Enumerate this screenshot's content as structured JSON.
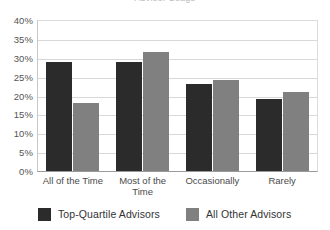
{
  "title_remnant": "Advisor Usage",
  "chart_data": {
    "type": "bar",
    "title": "",
    "xlabel": "",
    "ylabel": "",
    "ylim": [
      0,
      40
    ],
    "ytick_step": 5,
    "ytick_labels": [
      "40%",
      "35%",
      "30%",
      "25%",
      "20%",
      "15%",
      "10%",
      "5%",
      "0%"
    ],
    "ytick_values": [
      40,
      35,
      30,
      25,
      20,
      15,
      10,
      5,
      0
    ],
    "grid": true,
    "legend_position": "bottom",
    "categories": [
      "All of the Time",
      "Most of the Time",
      "Occasionally",
      "Rarely"
    ],
    "series": [
      {
        "name": "Top-Quartile Advisors",
        "color": "#2b2b2b",
        "values": [
          29,
          29,
          23,
          19
        ]
      },
      {
        "name": "All Other Advisors",
        "color": "#808080",
        "values": [
          18,
          31.5,
          24,
          21
        ]
      }
    ]
  }
}
